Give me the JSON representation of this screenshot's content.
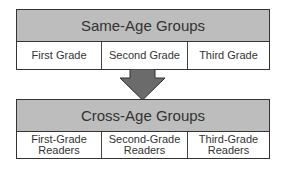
{
  "diagram": {
    "top_group": {
      "title": "Same-Age Groups",
      "cells": [
        "First Grade",
        "Second Grade",
        "Third Grade"
      ]
    },
    "arrow": {
      "direction": "down",
      "color": "#6b6b6b"
    },
    "bottom_group": {
      "title": "Cross-Age Groups",
      "cells": [
        {
          "line1": "First-Grade",
          "line2": "Readers"
        },
        {
          "line1": "Second-Grade",
          "line2": "Readers"
        },
        {
          "line1": "Third-Grade",
          "line2": "Readers"
        }
      ]
    },
    "colors": {
      "header_fill": "#bdbdbd",
      "border": "#333333"
    }
  }
}
